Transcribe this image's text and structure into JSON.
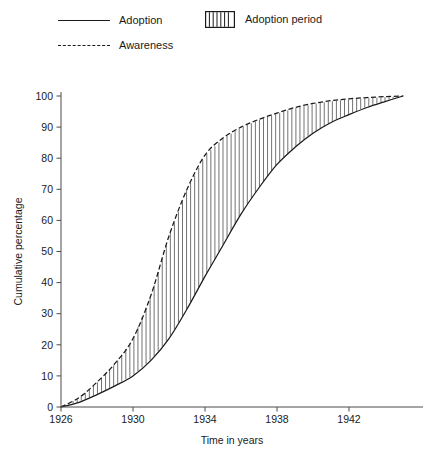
{
  "legend": {
    "entries": [
      {
        "label": "Adoption",
        "swatch": "solid-line-swatch"
      },
      {
        "label": "Awareness",
        "swatch": "dashed-line-swatch"
      },
      {
        "label": "Adoption period",
        "swatch": "vertical-hatch-swatch"
      }
    ]
  },
  "chart_data": {
    "type": "line",
    "title": "",
    "xlabel": "Time in years",
    "ylabel": "Cumulative percentage",
    "xlim": [
      1926,
      1945
    ],
    "ylim": [
      0,
      100
    ],
    "grid": false,
    "legend_position": "top-left",
    "xticks": [
      1926,
      1930,
      1934,
      1938,
      1942
    ],
    "xtick_labels": [
      "1926",
      "1930",
      "1934",
      "1938",
      "1942"
    ],
    "yticks": [
      0,
      10,
      20,
      30,
      40,
      50,
      60,
      70,
      80,
      90,
      100
    ],
    "ytick_labels": [
      "0",
      "10",
      "20",
      "30",
      "40",
      "50",
      "60",
      "70",
      "80",
      "90",
      "100"
    ],
    "x": [
      1926,
      1927,
      1928,
      1929,
      1930,
      1931,
      1932,
      1933,
      1934,
      1935,
      1936,
      1937,
      1938,
      1939,
      1940,
      1941,
      1942,
      1943,
      1944,
      1945
    ],
    "series": [
      {
        "name": "Awareness",
        "style": "dashed",
        "values": [
          0,
          3,
          8,
          14,
          22,
          36,
          55,
          70,
          81,
          86.5,
          90,
          92.5,
          94.5,
          96.3,
          97.6,
          98.5,
          99.1,
          99.5,
          99.8,
          100
        ]
      },
      {
        "name": "Adoption",
        "style": "solid",
        "values": [
          0,
          1.5,
          4,
          6.8,
          10,
          15,
          22,
          31.5,
          42,
          52,
          62,
          70.5,
          78,
          83.5,
          88,
          91.5,
          94,
          96.3,
          98.2,
          100
        ]
      }
    ],
    "annotations": [
      {
        "name": "adoption-period-band",
        "label": "Adoption period",
        "description": "Vertical hatching filling the region between the Awareness curve and the Adoption curve"
      }
    ]
  },
  "caption": {
    "text": ""
  }
}
